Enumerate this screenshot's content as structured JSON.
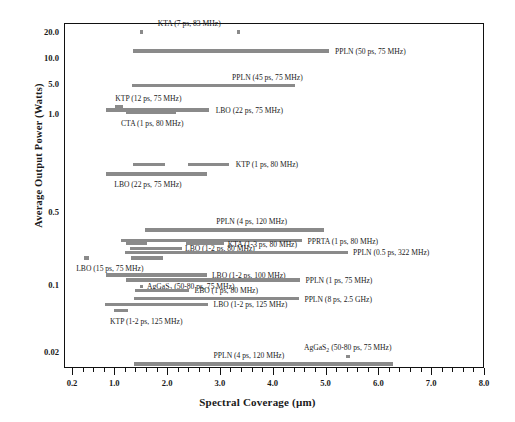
{
  "chart_data": {
    "type": "bar",
    "title": "",
    "xlabel": "Spectral Coverage (µm)",
    "ylabel": "Average Output Power (Watts)",
    "xlim": [
      0.2,
      8.0
    ],
    "xticks": [
      "0.2",
      "1.0",
      "2.0",
      "3.0",
      "4.0",
      "5.0",
      "6.0",
      "7.0",
      "8.0"
    ],
    "yticks": [
      "20.0",
      "10.0",
      "5.0",
      "1.0",
      "0.5",
      "0.1",
      "0.02",
      "0"
    ],
    "grid": false,
    "legend": "none",
    "bar_color": "#8a8a8a",
    "series": [
      {
        "label": "KTA (7 ps, 83 MHz)",
        "material": "KTA",
        "pulse": "7 ps",
        "rep_rate": "83 MHz",
        "power": 20.0,
        "segments": [
          [
            1.48,
            1.53
          ],
          [
            3.32,
            3.37
          ]
        ],
        "label_x": 2.42,
        "label_align": "center",
        "label_dy": -9
      },
      {
        "label": "PPLN (50 ps, 75 MHz)",
        "material": "PPLN",
        "pulse": "50 ps",
        "rep_rate": "75 MHz",
        "power": 12.0,
        "segments": [
          [
            1.36,
            5.06
          ]
        ],
        "label_x": 5.18,
        "label_align": "left",
        "label_dy": 0
      },
      {
        "label": "PPLN (45 ps, 75 MHz)",
        "material": "PPLN",
        "pulse": "45 ps",
        "rep_rate": "75 MHz",
        "power": 4.6,
        "segments": [
          [
            1.33,
            4.42
          ]
        ],
        "label_x": 3.9,
        "label_align": "center",
        "label_dy": -9
      },
      {
        "label": "KTP (12 ps, 75 MHz)",
        "material": "KTP",
        "pulse": "12 ps",
        "rep_rate": "75 MHz",
        "power": 1.45,
        "segments": [
          [
            1.02,
            1.16
          ]
        ],
        "label_x": 1.02,
        "label_align": "left",
        "label_dy": -9
      },
      {
        "label": "LBO (22 ps, 75 MHz)",
        "material": "LBO",
        "pulse": "22 ps",
        "rep_rate": "75 MHz",
        "power": 1.25,
        "segments": [
          [
            0.85,
            2.8
          ]
        ],
        "label_x": 2.92,
        "label_align": "left",
        "label_dy": 0
      },
      {
        "label": "CTA (1 ps, 80 MHz)",
        "material": "CTA",
        "pulse": "1 ps",
        "rep_rate": "80 MHz",
        "power": 1.07,
        "segments": [
          [
            1.22,
            2.16
          ]
        ],
        "label_x": 1.72,
        "label_align": "center",
        "label_dy": 10
      },
      {
        "label": "KTP (1 ps, 80 MHz)",
        "material": "KTP",
        "pulse": "1 ps",
        "rep_rate": "80 MHz",
        "power": 0.7,
        "segments": [
          [
            1.36,
            1.96
          ],
          [
            2.4,
            3.18
          ]
        ],
        "label_x": 3.3,
        "label_align": "left",
        "label_dy": 0
      },
      {
        "label": "LBO (22 ps, 75 MHz)",
        "material": "LBO",
        "pulse": "22 ps",
        "rep_rate": "75 MHz",
        "power": 0.655,
        "segments": [
          [
            0.85,
            2.75
          ]
        ],
        "label_x": 1.0,
        "label_align": "left",
        "label_dy": 10
      },
      {
        "label": "PPLN (4 ps, 120 MHz)",
        "material": "PPLN",
        "pulse": "4 ps",
        "rep_rate": "120 MHz",
        "power": 0.335,
        "segments": [
          [
            1.58,
            4.98
          ]
        ],
        "label_x": 3.6,
        "label_align": "center",
        "label_dy": -9
      },
      {
        "label": "PPRTA (1 ps, 80 MHz)",
        "material": "PPRTA",
        "pulse": "1 ps",
        "rep_rate": "80 MHz",
        "power": 0.265,
        "segments": [
          [
            1.12,
            4.55
          ]
        ],
        "label_x": 4.66,
        "label_align": "left",
        "label_dy": 0
      },
      {
        "label": "KTA (1-3 ps, 80 MHz)",
        "material": "KTA",
        "pulse": "1-3 ps",
        "rep_rate": "80 MHz",
        "power": 0.248,
        "segments": [
          [
            1.22,
            1.62
          ],
          [
            2.35,
            3.08
          ]
        ],
        "label_x": 3.15,
        "label_align": "left",
        "label_dy": 0
      },
      {
        "label": "LBO (1-2 ps, 80 MHz)",
        "material": "LBO",
        "pulse": "1-2 ps",
        "rep_rate": "80 MHz",
        "power": 0.225,
        "segments": [
          [
            1.3,
            2.28
          ]
        ],
        "label_x": 2.34,
        "label_align": "left",
        "label_dy": 0
      },
      {
        "label": "PPLN (0.5 ps, 322 MHz)",
        "material": "PPLN",
        "pulse": "0.5 ps",
        "rep_rate": "322 MHz",
        "power": 0.205,
        "segments": [
          [
            1.2,
            5.42
          ]
        ],
        "label_x": 5.52,
        "label_align": "left",
        "label_dy": 0
      },
      {
        "label": "LBO (15 ps, 75 MHz)",
        "material": "LBO",
        "pulse": "15 ps",
        "rep_rate": "75 MHz",
        "power": 0.182,
        "segments": [
          [
            0.43,
            0.52
          ],
          [
            1.32,
            1.92
          ]
        ],
        "label_x": 0.28,
        "label_align": "left",
        "label_dy": 10
      },
      {
        "label": "LBO (1-2 ps, 100 MHz)",
        "material": "LBO",
        "pulse": "1-2 ps",
        "rep_rate": "100 MHz",
        "power": 0.125,
        "segments": [
          [
            0.85,
            2.75
          ]
        ],
        "label_x": 2.85,
        "label_align": "left",
        "label_dy": 0
      },
      {
        "label": "PPLN (1 ps, 75 MHz)",
        "material": "PPLN",
        "pulse": "1 ps",
        "rep_rate": "75 MHz",
        "power": 0.112,
        "segments": [
          [
            1.22,
            4.52
          ]
        ],
        "label_x": 4.62,
        "label_align": "left",
        "label_dy": 0
      },
      {
        "label": "AgGaS<sub>2</sub> (50-80 ps, 75 MHz)",
        "material": "AgGaS2",
        "pulse": "50-80 ps",
        "rep_rate": "75 MHz",
        "power": 0.097,
        "segments": [
          [
            1.48,
            1.54
          ]
        ],
        "label_x": 1.62,
        "label_align": "left",
        "label_dy": 0
      },
      {
        "label": "LBO (1 ps, 80 MHz)",
        "material": "LBO",
        "pulse": "1 ps",
        "rep_rate": "80 MHz",
        "power": 0.088,
        "segments": [
          [
            1.4,
            2.42
          ]
        ],
        "label_x": 2.52,
        "label_align": "left",
        "label_dy": 0
      },
      {
        "label": "PPLN (8 ps, 2.5 GHz)",
        "material": "PPLN",
        "pulse": "8 ps",
        "rep_rate": "2.5 GHz",
        "power": 0.072,
        "segments": [
          [
            1.38,
            4.5
          ]
        ],
        "label_x": 4.6,
        "label_align": "left",
        "label_dy": 0
      },
      {
        "label": "LBO (1-2 ps, 125 MHz)",
        "material": "LBO",
        "pulse": "1-2 ps",
        "rep_rate": "125 MHz",
        "power": 0.063,
        "segments": [
          [
            0.83,
            2.78
          ]
        ],
        "label_x": 2.88,
        "label_align": "left",
        "label_dy": 0
      },
      {
        "label": "KTP (1-2 ps, 125 MHz)",
        "material": "KTP",
        "pulse": "1-2 ps",
        "rep_rate": "125 MHz",
        "power": 0.054,
        "segments": [
          [
            1.0,
            1.26
          ]
        ],
        "label_x": 0.92,
        "label_align": "left",
        "label_dy": 10
      },
      {
        "label": "AgGaS<sub>2</sub> (50-80 ps, 75 MHz)",
        "material": "AgGaS2",
        "pulse": "50-80 ps",
        "rep_rate": "75 MHz",
        "power": 0.013,
        "segments": [
          [
            5.38,
            5.46
          ]
        ],
        "label_x": 5.42,
        "label_align": "center",
        "label_dy": -9
      },
      {
        "label": "PPLN (4 ps, 120 MHz)",
        "material": "PPLN",
        "pulse": "4 ps",
        "rep_rate": "120 MHz",
        "power": 0.006,
        "segments": [
          [
            1.38,
            6.28
          ]
        ],
        "label_x": 3.55,
        "label_align": "center",
        "label_dy": -9
      }
    ]
  }
}
